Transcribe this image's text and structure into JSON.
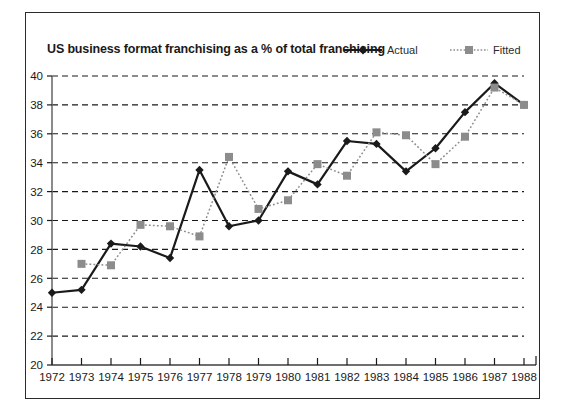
{
  "chart_data": {
    "type": "line",
    "title": "US business format franchising as a % of total franchising",
    "xlabel": "",
    "ylabel": "",
    "x": [
      1972,
      1973,
      1974,
      1975,
      1976,
      1977,
      1978,
      1979,
      1980,
      1981,
      1982,
      1983,
      1984,
      1985,
      1986,
      1987,
      1988
    ],
    "categories": [
      "1972",
      "1973",
      "1974",
      "1975",
      "1976",
      "1977",
      "1978",
      "1979",
      "1980",
      "1981",
      "1982",
      "1983",
      "1984",
      "1985",
      "1986",
      "1987",
      "1988"
    ],
    "xlim": [
      1972,
      1988
    ],
    "ylim": [
      20,
      40
    ],
    "yticks": [
      20,
      22,
      24,
      26,
      28,
      30,
      32,
      34,
      36,
      38,
      40
    ],
    "ytick_labels": [
      "20",
      "22",
      "24",
      "26",
      "28",
      "30",
      "32",
      "34",
      "36",
      "38",
      "40"
    ],
    "grid": true,
    "grid_style": "dashed-horizontal",
    "legend_position": "top-right",
    "series": [
      {
        "name": "Actual",
        "marker": "diamond",
        "line_style": "solid",
        "color": "#1a1a1a",
        "values": [
          25.0,
          25.2,
          28.4,
          28.2,
          27.4,
          33.5,
          29.6,
          30.0,
          33.4,
          32.5,
          35.5,
          35.3,
          33.4,
          35.0,
          37.5,
          39.5,
          38.0
        ]
      },
      {
        "name": "Fitted",
        "marker": "square",
        "line_style": "dotted",
        "color": "#8c8c8c",
        "values": [
          null,
          27.0,
          26.9,
          29.7,
          29.6,
          28.9,
          34.4,
          30.8,
          31.4,
          33.9,
          33.1,
          36.1,
          35.9,
          33.9,
          35.8,
          39.2,
          38.0
        ]
      }
    ]
  },
  "legend": {
    "actual_label": "Actual",
    "fitted_label": "Fitted"
  },
  "colors": {
    "actual": "#1a1a1a",
    "fitted": "#8c8c8c",
    "axis": "#6e6e6e",
    "grid": "#1a1a1a",
    "frame": "#2b2b2b",
    "background": "#ffffff"
  }
}
